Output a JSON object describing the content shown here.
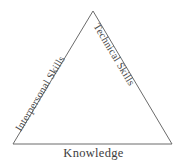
{
  "diagram": {
    "type": "triangle-concept-diagram",
    "background_color": "#ffffff",
    "stroke_color": "#6b6b6b",
    "stroke_width": 1,
    "text_color": "#4a4a4a",
    "vertices": {
      "apex": {
        "x": 93,
        "y": 11
      },
      "bottom_left": {
        "x": 13,
        "y": 144
      },
      "bottom_right": {
        "x": 172,
        "y": 144
      }
    },
    "labels": {
      "left_edge": "Interpersonal Skills",
      "right_edge": "Technical Skills",
      "base": "Knowledge"
    },
    "rotations": {
      "left_edge_deg": -59,
      "right_edge_deg": 59,
      "base_deg": 0
    }
  }
}
